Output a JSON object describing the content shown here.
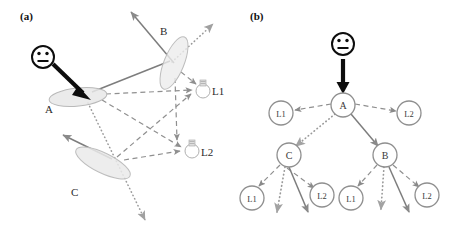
{
  "figure": {
    "width": 457,
    "height": 238,
    "background": "#ffffff"
  },
  "panels": [
    {
      "id": "a",
      "label": "(a)",
      "caption_position": "top-left",
      "description": "scene geometry with three surface patches, a viewer and two light sources",
      "viewer": {
        "icon": "smiley-face-icon",
        "eyes": 2,
        "mouth": "line"
      },
      "surfaces": [
        {
          "name": "A",
          "label": "A",
          "label_x": 47,
          "label_y": 110,
          "cx": 78,
          "cy": 97,
          "rx": 29,
          "ry": 9,
          "rot": -6
        },
        {
          "name": "B",
          "label": "B",
          "label_x": 163,
          "label_y": 33,
          "cx": 174,
          "cy": 63,
          "rx": 10,
          "ry": 28,
          "rot": 22
        },
        {
          "name": "C",
          "label": "C",
          "label_x": 74,
          "label_y": 192,
          "cx": 103,
          "cy": 163,
          "rx": 30,
          "ry": 10,
          "rot": 26
        }
      ],
      "lights": [
        {
          "name": "L1",
          "label": "L1",
          "icon": "light-bulb-icon",
          "x": 203,
          "y": 89,
          "label_x": 214,
          "label_y": 91
        },
        {
          "name": "L2",
          "label": "L2",
          "icon": "light-bulb-icon",
          "x": 192,
          "y": 148,
          "label_x": 203,
          "label_y": 153
        }
      ],
      "edge_styles": {
        "solid": "specular / direct reflection ray",
        "dashed": "light source illumination path",
        "dotted": "secondary transport path"
      }
    },
    {
      "id": "b",
      "label": "(b)",
      "caption_position": "top-left",
      "description": "light transport tree rooted at viewer",
      "viewer": {
        "icon": "smiley-face-icon",
        "eyes": 2,
        "mouth": "line"
      },
      "tree": {
        "root_arrow": "thick-down-arrow",
        "nodes": [
          {
            "id": "n-a",
            "label": "A",
            "x": 343,
            "y": 105,
            "r": 12,
            "level": 0
          },
          {
            "id": "n-l1-a",
            "label": "L1",
            "x": 281,
            "y": 113,
            "r": 12,
            "level": 1
          },
          {
            "id": "n-l2-a",
            "label": "L2",
            "x": 409,
            "y": 113,
            "r": 12,
            "level": 1
          },
          {
            "id": "n-c",
            "label": "C",
            "x": 289,
            "y": 155,
            "r": 12,
            "level": 1
          },
          {
            "id": "n-b",
            "label": "B",
            "x": 385,
            "y": 155,
            "r": 12,
            "level": 1
          },
          {
            "id": "n-l1-c",
            "label": "L1",
            "x": 252,
            "y": 198,
            "r": 12,
            "level": 2
          },
          {
            "id": "n-l2-c",
            "label": "L2",
            "x": 322,
            "y": 195,
            "r": 12,
            "level": 2
          },
          {
            "id": "n-l1-b",
            "label": "L1",
            "x": 360,
            "y": 198,
            "r": 12,
            "level": 2
          },
          {
            "id": "n-l2-b",
            "label": "L2",
            "x": 428,
            "y": 195,
            "r": 12,
            "level": 2
          }
        ],
        "edges": [
          {
            "from": "n-a",
            "to": "n-l1-a",
            "style": "dashed"
          },
          {
            "from": "n-a",
            "to": "n-l2-a",
            "style": "dashed"
          },
          {
            "from": "n-a",
            "to": "n-c",
            "style": "dotted"
          },
          {
            "from": "n-a",
            "to": "n-b",
            "style": "solid"
          },
          {
            "from": "n-c",
            "to": "n-l1-c",
            "style": "dashed"
          },
          {
            "from": "n-c",
            "to": "n-l2-c",
            "style": "dashed"
          },
          {
            "from": "n-c",
            "to": "open-dotted",
            "style": "dotted"
          },
          {
            "from": "n-c",
            "to": "open-solid",
            "style": "solid"
          },
          {
            "from": "n-b",
            "to": "n-l1-b",
            "style": "dashed"
          },
          {
            "from": "n-b",
            "to": "n-l2-b",
            "style": "dashed"
          },
          {
            "from": "n-b",
            "to": "open-dotted",
            "style": "dotted"
          },
          {
            "from": "n-b",
            "to": "open-solid",
            "style": "solid"
          }
        ]
      }
    }
  ],
  "colors": {
    "ink": "#2b2b2b",
    "gray_stroke": "#8a8a8a",
    "light_gray_stroke": "#a6a6a6",
    "ellipse_fill": "#e9e9e9",
    "ellipse_stroke": "#b5b5b5",
    "node_stroke": "#8f8f8f",
    "black": "#000000"
  }
}
